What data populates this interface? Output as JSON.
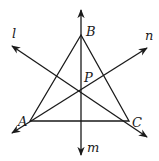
{
  "figure": {
    "width": 159,
    "height": 161,
    "stroke_color": "#1a1a1a",
    "background": "#ffffff"
  },
  "points": {
    "A": {
      "label": "A",
      "x": 30,
      "y": 121,
      "label_x": 18,
      "label_y": 126
    },
    "B": {
      "label": "B",
      "x": 81,
      "y": 35,
      "label_x": 86,
      "label_y": 36
    },
    "C": {
      "label": "C",
      "x": 129,
      "y": 121,
      "label_x": 132,
      "label_y": 127
    },
    "P": {
      "label": "P",
      "x": 81,
      "y": 91,
      "label_x": 84,
      "label_y": 82
    }
  },
  "triangle": {
    "vertices": [
      "A",
      "B",
      "C"
    ]
  },
  "lines": {
    "l": {
      "label": "l",
      "x1": 12,
      "y1": 46,
      "x2": 147,
      "y2": 137,
      "label_x": 12,
      "label_y": 38
    },
    "m": {
      "label": "m",
      "x1": 81,
      "y1": 10,
      "x2": 81,
      "y2": 155,
      "label_x": 87,
      "label_y": 152
    },
    "n": {
      "label": "n",
      "x1": 12,
      "y1": 133,
      "x2": 147,
      "y2": 48,
      "label_x": 145,
      "label_y": 40
    }
  }
}
